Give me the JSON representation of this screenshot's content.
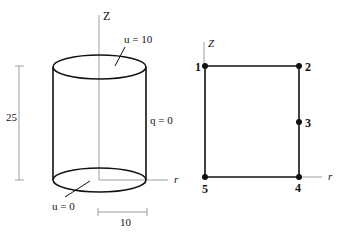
{
  "left_figure": {
    "axis_z_label": "Z",
    "axis_r_label": "r",
    "top_bc": "u = 10",
    "side_bc": "q = 0",
    "bottom_bc": "u = 0",
    "height_dim": "25",
    "radius_dim": "10"
  },
  "right_figure": {
    "axis_z_label": "Z",
    "axis_r_label": "r",
    "nodes": [
      {
        "id": "1",
        "x": 205,
        "y": 66
      },
      {
        "id": "2",
        "x": 299,
        "y": 66
      },
      {
        "id": "3",
        "x": 299,
        "y": 122
      },
      {
        "id": "4",
        "x": 299,
        "y": 177
      },
      {
        "id": "5",
        "x": 205,
        "y": 177
      }
    ]
  },
  "colors": {
    "line": "#111111",
    "thin": "#888888"
  }
}
